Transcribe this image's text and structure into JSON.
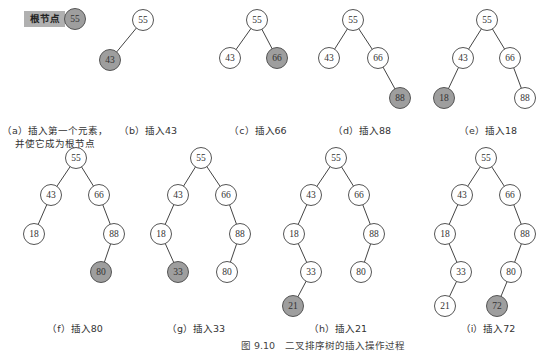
{
  "legend": {
    "label": "根节点",
    "value": "55"
  },
  "figure_title": "图 9.10　二叉排序树的插入操作过程",
  "panels": [
    {
      "id": "a",
      "caption": "（a）插入第一个元素，",
      "caption2": "并使它成为根节点",
      "nodes": [],
      "edges": []
    },
    {
      "id": "b",
      "caption": "（b）插入43",
      "nodes": [
        {
          "v": "55",
          "x": 143,
          "y": 20
        },
        {
          "v": "43",
          "x": 110,
          "y": 60,
          "hl": true
        }
      ],
      "edges": [
        [
          0,
          1
        ]
      ]
    },
    {
      "id": "c",
      "caption": "（c）插入66",
      "nodes": [
        {
          "v": "55",
          "x": 257,
          "y": 20
        },
        {
          "v": "43",
          "x": 230,
          "y": 58
        },
        {
          "v": "66",
          "x": 277,
          "y": 58,
          "hl": true
        }
      ],
      "edges": [
        [
          0,
          1
        ],
        [
          0,
          2
        ]
      ]
    },
    {
      "id": "d",
      "caption": "（d）插入88",
      "nodes": [
        {
          "v": "55",
          "x": 353,
          "y": 20
        },
        {
          "v": "43",
          "x": 329,
          "y": 58
        },
        {
          "v": "66",
          "x": 378,
          "y": 58
        },
        {
          "v": "88",
          "x": 400,
          "y": 98,
          "hl": true
        }
      ],
      "edges": [
        [
          0,
          1
        ],
        [
          0,
          2
        ],
        [
          2,
          3
        ]
      ]
    },
    {
      "id": "e",
      "caption": "（e）插入18",
      "nodes": [
        {
          "v": "55",
          "x": 487,
          "y": 20
        },
        {
          "v": "43",
          "x": 463,
          "y": 58
        },
        {
          "v": "66",
          "x": 510,
          "y": 58
        },
        {
          "v": "18",
          "x": 444,
          "y": 98,
          "hl": true
        },
        {
          "v": "88",
          "x": 525,
          "y": 98
        }
      ],
      "edges": [
        [
          0,
          1
        ],
        [
          0,
          2
        ],
        [
          1,
          3
        ],
        [
          2,
          4
        ]
      ]
    },
    {
      "id": "f",
      "caption": "（f）插入80",
      "nodes": [
        {
          "v": "55",
          "x": 76,
          "y": 158
        },
        {
          "v": "43",
          "x": 51,
          "y": 195
        },
        {
          "v": "66",
          "x": 99,
          "y": 195
        },
        {
          "v": "18",
          "x": 34,
          "y": 234
        },
        {
          "v": "88",
          "x": 114,
          "y": 234
        },
        {
          "v": "80",
          "x": 101,
          "y": 272,
          "hl": true
        }
      ],
      "edges": [
        [
          0,
          1
        ],
        [
          0,
          2
        ],
        [
          1,
          3
        ],
        [
          2,
          4
        ],
        [
          4,
          5
        ]
      ]
    },
    {
      "id": "g",
      "caption": "（g）插入33",
      "nodes": [
        {
          "v": "55",
          "x": 201,
          "y": 158
        },
        {
          "v": "43",
          "x": 178,
          "y": 195
        },
        {
          "v": "66",
          "x": 226,
          "y": 195
        },
        {
          "v": "18",
          "x": 161,
          "y": 234
        },
        {
          "v": "88",
          "x": 240,
          "y": 234
        },
        {
          "v": "33",
          "x": 178,
          "y": 272,
          "hl": true
        },
        {
          "v": "80",
          "x": 227,
          "y": 272
        }
      ],
      "edges": [
        [
          0,
          1
        ],
        [
          0,
          2
        ],
        [
          1,
          3
        ],
        [
          2,
          4
        ],
        [
          3,
          5
        ],
        [
          4,
          6
        ]
      ]
    },
    {
      "id": "h",
      "caption": "（h）插入21",
      "nodes": [
        {
          "v": "55",
          "x": 336,
          "y": 158
        },
        {
          "v": "43",
          "x": 311,
          "y": 195
        },
        {
          "v": "66",
          "x": 359,
          "y": 195
        },
        {
          "v": "18",
          "x": 294,
          "y": 234
        },
        {
          "v": "88",
          "x": 374,
          "y": 234
        },
        {
          "v": "33",
          "x": 311,
          "y": 272
        },
        {
          "v": "80",
          "x": 361,
          "y": 272
        },
        {
          "v": "21",
          "x": 293,
          "y": 306,
          "hl": true
        }
      ],
      "edges": [
        [
          0,
          1
        ],
        [
          0,
          2
        ],
        [
          1,
          3
        ],
        [
          2,
          4
        ],
        [
          3,
          5
        ],
        [
          4,
          6
        ],
        [
          5,
          7
        ]
      ]
    },
    {
      "id": "i",
      "caption": "（i）插入72",
      "nodes": [
        {
          "v": "55",
          "x": 486,
          "y": 158
        },
        {
          "v": "43",
          "x": 462,
          "y": 195
        },
        {
          "v": "66",
          "x": 510,
          "y": 195
        },
        {
          "v": "18",
          "x": 445,
          "y": 234
        },
        {
          "v": "88",
          "x": 525,
          "y": 234
        },
        {
          "v": "33",
          "x": 461,
          "y": 272
        },
        {
          "v": "80",
          "x": 511,
          "y": 272
        },
        {
          "v": "21",
          "x": 445,
          "y": 306
        },
        {
          "v": "72",
          "x": 497,
          "y": 306,
          "hl": true
        }
      ],
      "edges": [
        [
          0,
          1
        ],
        [
          0,
          2
        ],
        [
          1,
          3
        ],
        [
          2,
          4
        ],
        [
          3,
          5
        ],
        [
          4,
          6
        ],
        [
          5,
          7
        ],
        [
          6,
          8
        ]
      ]
    }
  ],
  "caption_positions": {
    "a": {
      "x": 55,
      "y": 124
    },
    "b": {
      "x": 148,
      "y": 124
    },
    "c": {
      "x": 258,
      "y": 124
    },
    "d": {
      "x": 362,
      "y": 124
    },
    "e": {
      "x": 488,
      "y": 124
    },
    "f": {
      "x": 75,
      "y": 322
    },
    "g": {
      "x": 196,
      "y": 322
    },
    "h": {
      "x": 338,
      "y": 322
    },
    "i": {
      "x": 488,
      "y": 322
    }
  },
  "colors": {
    "highlight": "#9e9e9e",
    "legend_bg": "#b0b0b0",
    "stroke": "#555555"
  }
}
